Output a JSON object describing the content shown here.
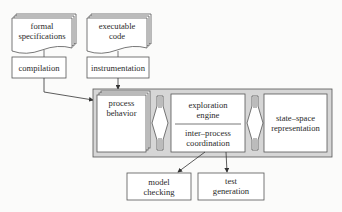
{
  "diagram": {
    "inputs": [
      {
        "id": "formal-specifications",
        "label": "formal\nspecifications",
        "shape": "document-stack"
      },
      {
        "id": "executable-code",
        "label": "executable\ncode",
        "shape": "document-stack"
      }
    ],
    "transforms": [
      {
        "id": "compilation",
        "label": "compilation"
      },
      {
        "id": "instrumentation",
        "label": "instrumentation"
      }
    ],
    "core": {
      "process_behavior": {
        "label": "process\nbehavior",
        "shape": "page-stack"
      },
      "exploration_engine": {
        "label": "exploration\nengine"
      },
      "inter_process_coordination": {
        "label": "inter–process\ncoordination"
      },
      "state_space_representation": {
        "label": "state–space\nrepresentation"
      }
    },
    "outputs": [
      {
        "id": "model-checking",
        "label": "model\nchecking"
      },
      {
        "id": "test-generation",
        "label": "test\ngeneration"
      }
    ],
    "edges": [
      [
        "formal-specifications",
        "compilation"
      ],
      [
        "executable-code",
        "instrumentation"
      ],
      [
        "compilation",
        "process-behavior"
      ],
      [
        "instrumentation",
        "process-behavior"
      ],
      [
        "process-behavior",
        "exploration-engine",
        "bidirectional"
      ],
      [
        "exploration-engine",
        "state-space-representation",
        "bidirectional"
      ],
      [
        "exploration-engine",
        "model-checking"
      ],
      [
        "exploration-engine",
        "test-generation"
      ]
    ],
    "colors": {
      "stroke": "#555555",
      "box_fill": "#ffffff",
      "container_fill": "#d6d6d6",
      "background": "#fbfbfa"
    }
  }
}
